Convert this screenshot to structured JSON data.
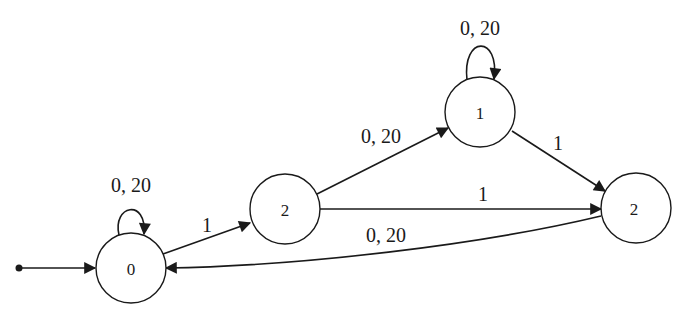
{
  "diagram": {
    "type": "state-machine",
    "colors": {
      "stroke": "#1a1a1a",
      "background": "#ffffff"
    },
    "initial": {
      "target": "n0"
    },
    "nodes": [
      {
        "id": "n0",
        "label": "0"
      },
      {
        "id": "n2a",
        "label": "2"
      },
      {
        "id": "n1",
        "label": "1"
      },
      {
        "id": "n2b",
        "label": "2"
      }
    ],
    "edges": [
      {
        "from": "n0",
        "to": "n0",
        "label": "0, 20"
      },
      {
        "from": "n0",
        "to": "n2a",
        "label": "1"
      },
      {
        "from": "n2a",
        "to": "n1",
        "label": "0, 20"
      },
      {
        "from": "n1",
        "to": "n1",
        "label": "0, 20"
      },
      {
        "from": "n1",
        "to": "n2b",
        "label": "1"
      },
      {
        "from": "n2a",
        "to": "n2b",
        "label": "1"
      },
      {
        "from": "n2b",
        "to": "n0",
        "label": "0, 20"
      }
    ]
  }
}
